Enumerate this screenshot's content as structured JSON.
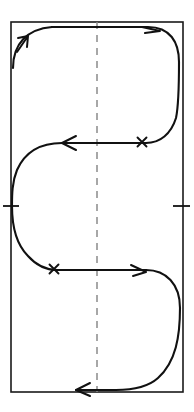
{
  "figure": {
    "width": 194,
    "height": 412,
    "background_color": "#ffffff"
  },
  "colors": {
    "frame_stroke": "#1a1a1a",
    "trajectory_stroke": "#111111",
    "centerline_stroke": "#8a8a8a",
    "marker_stroke": "#111111",
    "paper": "#ffffff"
  },
  "frame": {
    "name": "bounding-rectangle",
    "x": 11,
    "y": 22,
    "width": 172,
    "height": 370,
    "stroke_width": 1.6
  },
  "centerline": {
    "name": "vertical-dashed-centerline",
    "x": 97,
    "y_top": 22,
    "y_bottom": 392,
    "dash_pattern": "7 6",
    "style": "dashed"
  },
  "trajectory": {
    "name": "s-curve-path",
    "stroke_width": 2.1,
    "segments": [
      {
        "id": "entry-lower-left",
        "description": "Curve rises from the left interior and bends right into the top run",
        "path": "M 13,68 C 13,44 27,29 52,27"
      },
      {
        "id": "top-run-and-right-loop",
        "description": "Runs right along the top, then curls clockwise down the right side",
        "path": "M 52,27 L 148,27 C 170,27 179,42 179,62 C 179,86 179,104 176,118 C 171,134 160,143 146,143"
      },
      {
        "id": "mid-run-leftward",
        "description": "Horizontal run from the right-center leftward across the centerline",
        "path": "M 146,143 L 62,143"
      },
      {
        "id": "left-loop",
        "description": "Curls counter-clockwise around the left side, touching the left border",
        "path": "M 62,143 C 40,143 25,152 17,170 C 12,182 12,195 12,206 C 12,226 16,244 28,256 C 36,265 46,270 57,270"
      },
      {
        "id": "mid-run-rightward",
        "description": "Horizontal run from the left-center rightward across the centerline",
        "path": "M 57,270 L 146,270"
      },
      {
        "id": "lower-right-loop",
        "description": "Curls clockwise down around the lower right, touching the right border",
        "path": "M 146,270 C 166,270 180,284 180,308 C 180,336 176,362 158,378 C 148,387 134,390 116,390"
      },
      {
        "id": "bottom-run-exit",
        "description": "Exits leftward along the bottom edge",
        "path": "M 116,390 L 76,390"
      }
    ]
  },
  "arrowheads": [
    {
      "name": "arrowhead-up-right-top-left",
      "direction": "up-right",
      "tip_x": 27,
      "tip_y": 37,
      "path": "M 17,52 L 28,36 M 28,36 L 18,38 M 28,36 L 27,47"
    },
    {
      "name": "arrowhead-right-top",
      "direction": "right",
      "tip_x": 160,
      "tip_y": 31,
      "path": "M 160,31 L 142,27 M 160,31 L 145,33"
    },
    {
      "name": "arrowhead-left-middle",
      "direction": "left",
      "tip_x": 62,
      "tip_y": 143,
      "path": "M 62,143 L 76,136 M 62,143 L 76,150"
    },
    {
      "name": "arrowhead-right-lower-middle",
      "direction": "right",
      "tip_x": 146,
      "tip_y": 272,
      "path": "M 146,272 L 131,265 M 146,272 L 133,276"
    },
    {
      "name": "arrowhead-left-bottom",
      "direction": "left",
      "tip_x": 76,
      "tip_y": 390,
      "path": "M 76,390 L 90,383 M 76,390 L 90,396"
    }
  ],
  "cross_marks": [
    {
      "name": "cross-mark-upper-right",
      "x": 142,
      "y": 142,
      "size": 9,
      "description": "X marker on the upper horizontal run, right of the centerline"
    },
    {
      "name": "cross-mark-lower-left",
      "x": 54,
      "y": 269,
      "size": 9,
      "description": "X marker on the lower horizontal run, left of the centerline"
    }
  ],
  "tick_marks": [
    {
      "name": "tick-mark-left-border",
      "x": 11,
      "y": 206,
      "x1": 3,
      "x2": 19,
      "orientation": "horizontal",
      "description": "Short horizontal tick crossing the left border at mid-height"
    },
    {
      "name": "tick-mark-right-border",
      "x": 183,
      "y": 206,
      "x1": 173,
      "x2": 190,
      "orientation": "horizontal",
      "description": "Short horizontal tick crossing the right border at mid-height"
    }
  ]
}
